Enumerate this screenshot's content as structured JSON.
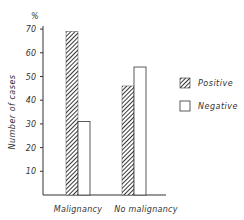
{
  "chart_data": {
    "type": "bar",
    "title": "",
    "xlabel": "",
    "ylabel": "Number of cases",
    "yunit": "%",
    "ylim": [
      0,
      70
    ],
    "yticks": [
      10,
      20,
      30,
      40,
      50,
      60,
      70
    ],
    "categories": [
      "Malignancy",
      "No malignancy"
    ],
    "series": [
      {
        "name": "Positive",
        "pattern": "diagonal-hatch",
        "values": [
          69,
          46
        ]
      },
      {
        "name": "Negative",
        "pattern": "none",
        "values": [
          31,
          54
        ]
      }
    ],
    "legend_position": "right",
    "grid": false
  },
  "colors": {
    "ink": "#333333",
    "background": "#ffffff"
  }
}
